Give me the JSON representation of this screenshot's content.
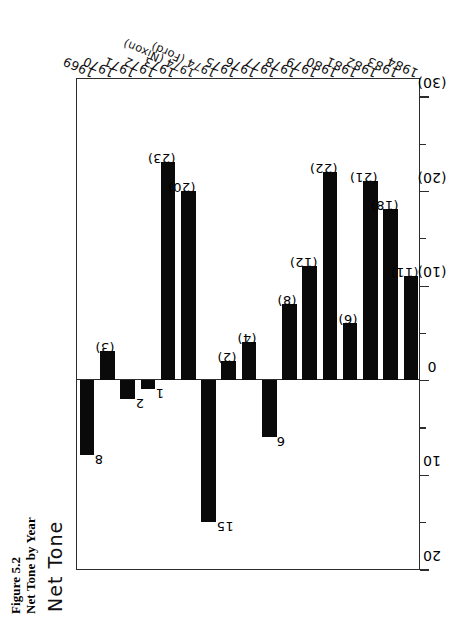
{
  "caption": {
    "figure_number": "Figure 5.2",
    "figure_title": "Net Tone by Year"
  },
  "axis_title": "Net Tone",
  "chart_data": {
    "type": "bar",
    "orientation": "horizontal",
    "title": "Net Tone by Year",
    "xlabel": "",
    "ylabel": "Net Tone",
    "grid": false,
    "legend": "none",
    "value_axis": {
      "label": "Net Tone",
      "min": 20,
      "max": -32,
      "tick_interval": 5,
      "label_interval": 10,
      "tick_values": [
        20,
        15,
        10,
        5,
        0,
        -5,
        -10,
        -15,
        -20,
        -25,
        -30
      ],
      "tick_labels": [
        "20",
        "",
        "10",
        "",
        "0",
        "",
        "(10)",
        "",
        "(20)",
        "",
        "(30)"
      ]
    },
    "categories": [
      "1969",
      "1970",
      "1971",
      "1972",
      "1973",
      "1974 (Nixon)",
      "1974 (Ford)",
      "1975",
      "1976",
      "1977",
      "1978",
      "1979",
      "1980",
      "1981",
      "1982",
      "1983",
      "1984"
    ],
    "values": [
      8,
      -3,
      2,
      1,
      -23,
      -20,
      15,
      -2,
      -4,
      6,
      -8,
      -12,
      -22,
      -6,
      -21,
      -18,
      -11
    ],
    "value_labels": [
      "8",
      "(3)",
      "2",
      "1",
      "(23)",
      "(20)",
      "15",
      "(2)",
      "(4)",
      "6",
      "(8)",
      "(12)",
      "(22)",
      "(6)",
      "(21)",
      "(18)",
      "(11)"
    ],
    "bar_color": "#0a0a0a",
    "axis_color": "#2c2c2c"
  }
}
